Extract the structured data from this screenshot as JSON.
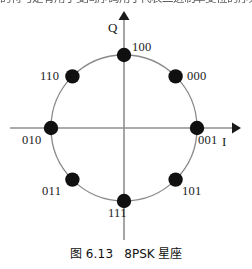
{
  "header": {
    "clipped_text": "的符号是有用于变间序码用于代表二进制单变位的序列"
  },
  "figure": {
    "axes": {
      "x_label": "I",
      "y_label": "Q"
    },
    "constellation": {
      "order": 8,
      "modulation": "8PSK",
      "points": [
        {
          "label": "001",
          "angle_deg": 0,
          "label_pos": "below-right"
        },
        {
          "label": "000",
          "angle_deg": 45,
          "label_pos": "right"
        },
        {
          "label": "100",
          "angle_deg": 90,
          "label_pos": "above-right"
        },
        {
          "label": "110",
          "angle_deg": 135,
          "label_pos": "left"
        },
        {
          "label": "010",
          "angle_deg": 180,
          "label_pos": "below-left"
        },
        {
          "label": "011",
          "angle_deg": 225,
          "label_pos": "left"
        },
        {
          "label": "111",
          "angle_deg": 270,
          "label_pos": "below-left"
        },
        {
          "label": "101",
          "angle_deg": 315,
          "label_pos": "right"
        }
      ]
    }
  },
  "caption": {
    "figure_number": "图 6.13",
    "title": "8PSK 星座"
  },
  "colors": {
    "point_fill": "#101010",
    "circle_stroke": "#8a8a8a",
    "axis_stroke": "#8f8f8f",
    "text": "#1a1a1a",
    "background": "#ffffff"
  }
}
